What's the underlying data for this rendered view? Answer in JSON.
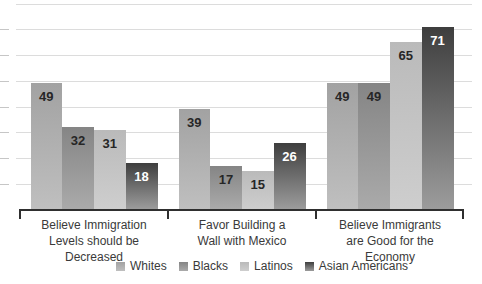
{
  "chart_data": {
    "type": "bar",
    "title": "",
    "xlabel": "",
    "ylabel": "",
    "categories": [
      "Believe Immigration Levels should be Decreased",
      "Favor Building a Wall with Mexico",
      "Believe Immigrants are Good for the Economy"
    ],
    "category_lines": [
      [
        "Believe Immigration",
        "Levels should be",
        "Decreased"
      ],
      [
        "Favor Building a",
        "Wall with Mexico"
      ],
      [
        "Believe Immigrants",
        "are Good for the",
        "Economy"
      ]
    ],
    "series": [
      {
        "name": "Whites",
        "values": [
          49,
          39,
          49
        ],
        "color_top": "#a2a2a2",
        "color_bottom": "#bfbfbf",
        "label_color": "#262626"
      },
      {
        "name": "Blacks",
        "values": [
          32,
          17,
          49
        ],
        "color_top": "#858585",
        "color_bottom": "#aaaaaa",
        "label_color": "#262626"
      },
      {
        "name": "Latinos",
        "values": [
          31,
          15,
          65
        ],
        "color_top": "#bababa",
        "color_bottom": "#cecece",
        "label_color": "#262626"
      },
      {
        "name": "Asian Americans",
        "values": [
          18,
          26,
          71
        ],
        "color_top": "#3e3e3e",
        "color_bottom": "#9c9c9c",
        "label_color": "#ffffff"
      }
    ],
    "ylim": [
      0,
      80
    ],
    "gridline_step": 10,
    "grid": true,
    "legend_position": "bottom"
  },
  "style": {
    "background": "#ffffff",
    "gridline_color": "#dcdcdc",
    "outer_tick_color": "#c6c6c6",
    "axis_color": "#2f2f2f",
    "category_text_color": "#3a3a3a",
    "legend_text_color": "#3a3a3a"
  }
}
